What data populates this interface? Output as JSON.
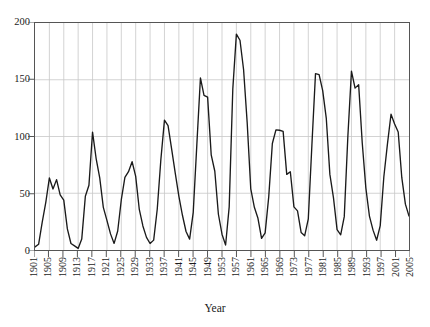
{
  "chart_data": {
    "type": "line",
    "title": "",
    "subtitle": "",
    "xlabel": "Year",
    "ylabel": "",
    "grid": "vertical-and-horizontal",
    "legend": "none",
    "line_color": "#1a1a1a",
    "grid_color": "#c8c8c8",
    "axis_color": "#555555",
    "xlim": [
      1901,
      2005
    ],
    "ylim": [
      0,
      200
    ],
    "yticks": [
      0,
      50,
      100,
      150,
      200
    ],
    "ytick_labels": [
      "0",
      "50",
      "100",
      "150",
      "200"
    ],
    "xticks": [
      1901,
      1905,
      1909,
      1913,
      1917,
      1921,
      1925,
      1929,
      1933,
      1937,
      1941,
      1945,
      1949,
      1953,
      1957,
      1961,
      1965,
      1969,
      1973,
      1977,
      1981,
      1985,
      1989,
      1993,
      1997,
      2001,
      2005
    ],
    "xtick_labels": [
      "1901",
      "1905",
      "1909",
      "1913",
      "1917",
      "1921",
      "1925",
      "1929",
      "1933",
      "1937",
      "1941",
      "1945",
      "1949",
      "1953",
      "1957",
      "1961",
      "1965",
      "1969",
      "1973",
      "1977",
      "1981",
      "1985",
      "1989",
      "1993",
      "1997",
      "2001",
      "2005"
    ],
    "x": [
      1901,
      1902,
      1903,
      1904,
      1905,
      1906,
      1907,
      1908,
      1909,
      1910,
      1911,
      1912,
      1913,
      1914,
      1915,
      1916,
      1917,
      1918,
      1919,
      1920,
      1921,
      1922,
      1923,
      1924,
      1925,
      1926,
      1927,
      1928,
      1929,
      1930,
      1931,
      1932,
      1933,
      1934,
      1935,
      1936,
      1937,
      1938,
      1939,
      1940,
      1941,
      1942,
      1943,
      1944,
      1945,
      1946,
      1947,
      1948,
      1949,
      1950,
      1951,
      1952,
      1953,
      1954,
      1955,
      1956,
      1957,
      1958,
      1959,
      1960,
      1961,
      1962,
      1963,
      1964,
      1965,
      1966,
      1967,
      1968,
      1969,
      1970,
      1971,
      1972,
      1973,
      1974,
      1975,
      1976,
      1977,
      1978,
      1979,
      1980,
      1981,
      1982,
      1983,
      1984,
      1985,
      1986,
      1987,
      1988,
      1989,
      1990,
      1991,
      1992,
      1993,
      1994,
      1995,
      1996,
      1997,
      1998,
      1999,
      2000,
      2001,
      2002,
      2003,
      2004,
      2005
    ],
    "values": [
      2.7,
      5.0,
      24.4,
      42.0,
      63.5,
      53.8,
      62.0,
      48.5,
      43.9,
      18.6,
      5.7,
      3.6,
      1.4,
      9.6,
      47.4,
      57.1,
      103.9,
      80.6,
      63.6,
      37.6,
      26.1,
      14.2,
      5.8,
      16.7,
      44.3,
      63.9,
      69.0,
      77.8,
      64.9,
      35.7,
      21.2,
      11.1,
      5.7,
      8.7,
      36.1,
      79.7,
      114.4,
      109.6,
      88.8,
      67.8,
      47.5,
      30.6,
      16.3,
      9.6,
      33.2,
      92.6,
      151.6,
      136.3,
      134.7,
      83.9,
      69.4,
      31.5,
      13.9,
      4.4,
      38.0,
      141.7,
      190.2,
      184.8,
      159.0,
      112.3,
      53.9,
      37.6,
      27.9,
      10.2,
      15.1,
      47.0,
      93.8,
      105.9,
      105.5,
      104.5,
      66.6,
      68.9,
      38.0,
      34.5,
      15.5,
      12.6,
      27.5,
      92.5,
      155.4,
      154.6,
      140.4,
      115.9,
      66.6,
      45.9,
      17.9,
      13.4,
      29.4,
      100.2,
      157.6,
      142.6,
      145.7,
      94.3,
      54.6,
      29.9,
      17.5,
      8.6,
      21.5,
      64.3,
      93.3,
      119.6,
      111.0,
      104.0,
      63.7,
      40.4,
      29.8
    ]
  },
  "axis_title": {
    "x": "Year"
  }
}
